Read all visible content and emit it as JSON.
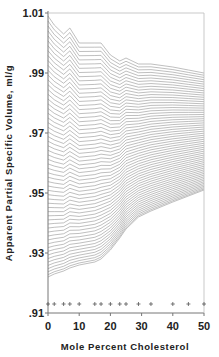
{
  "chart_data": {
    "type": "line",
    "subtype": "stacked-contour-family",
    "title": "",
    "xlabel": "Mole Percent Cholesterol",
    "ylabel": "Apparent Partial Specific Volume,  ml/g",
    "xlim": [
      0,
      50
    ],
    "ylim": [
      0.91,
      1.01
    ],
    "x_ticks": [
      0,
      10,
      20,
      30,
      40,
      50
    ],
    "x_tick_labels": [
      "0",
      "10",
      "20",
      "30",
      "40",
      "50"
    ],
    "y_ticks": [
      1.01,
      0.99,
      0.97,
      0.95,
      0.93,
      0.91
    ],
    "y_tick_labels": [
      "1.01",
      ".99",
      ".97",
      ".95",
      ".93",
      ".91"
    ],
    "grid": false,
    "legend": null,
    "sample_markers": {
      "symbol": "+",
      "y": 0.913,
      "x": [
        0,
        2,
        5,
        7,
        10,
        15,
        17,
        20,
        23,
        25,
        29,
        33,
        40,
        45,
        50
      ]
    },
    "x": [
      0,
      2,
      5,
      7,
      10,
      15,
      17,
      20,
      23,
      25,
      29,
      33,
      40,
      45,
      50
    ],
    "series": [
      {
        "name": "upper envelope",
        "values": [
          1.009,
          1.006,
          1.003,
          1.005,
          1.0,
          1.0,
          1.0,
          0.996,
          0.994,
          0.995,
          0.993,
          0.993,
          0.992,
          0.991,
          0.99
        ]
      },
      {
        "name": "lower envelope",
        "values": [
          0.922,
          0.923,
          0.924,
          0.925,
          0.926,
          0.927,
          0.928,
          0.931,
          0.935,
          0.938,
          0.942,
          0.944,
          0.947,
          0.949,
          0.951
        ]
      }
    ],
    "contour_line_count": 60,
    "line_color": "#8a8a8a",
    "axis_color": "#777777"
  }
}
